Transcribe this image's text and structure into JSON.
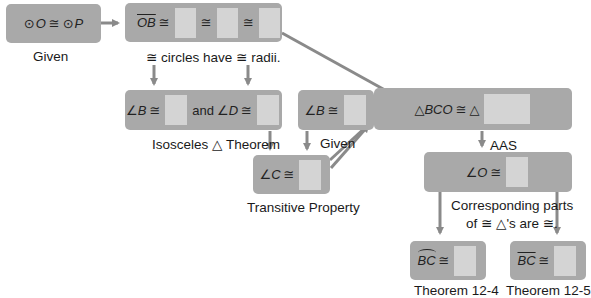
{
  "diagram": {
    "type": "flow-proof",
    "colors": {
      "box": "#a9a9a9",
      "blank": "#d4d4d4",
      "arrow": "#8a8a8a",
      "text": "#1a1a1a"
    },
    "nodes": {
      "given_circles": {
        "lhs": "O",
        "rel": "≅",
        "rhs": "P",
        "circle_symbol": "⊙",
        "reason": "Given"
      },
      "radii": {
        "lhs": "OB",
        "rel": "≅",
        "blanks": 3,
        "reason": "≅ circles have ≅ radii."
      },
      "isosceles": {
        "angle_b": "∠B",
        "rel": "≅",
        "and": "and",
        "angle_d": "∠D",
        "reason": "Isosceles △ Theorem"
      },
      "given_angle": {
        "angle": "∠B",
        "rel": "≅",
        "reason": "Given"
      },
      "transitive": {
        "angle": "∠C",
        "rel": "≅",
        "reason": "Transitive Property"
      },
      "triangles": {
        "lhs": "△BCO",
        "rel": "≅",
        "rhs": "△",
        "reason": "AAS"
      },
      "angle_o": {
        "angle": "∠O",
        "rel": "≅",
        "reason_line1": "Corresponding parts",
        "reason_line2": "of ≅ △'s are ≅."
      },
      "arc_bc": {
        "arc": "BC",
        "rel": "≅",
        "reason": "Theorem 12-4"
      },
      "chord_bc": {
        "chord": "BC",
        "rel": "≅",
        "reason": "Theorem 12-5"
      }
    }
  }
}
